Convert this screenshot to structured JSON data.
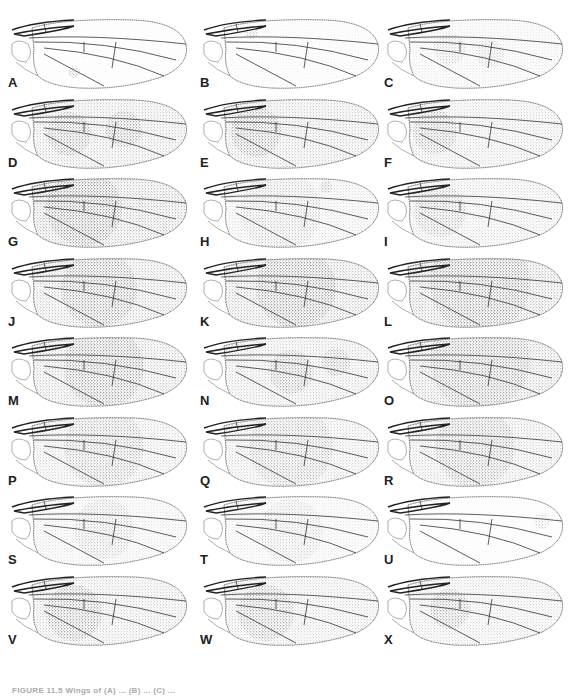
{
  "figure": {
    "panels": [
      {
        "label": "A",
        "shade": 0.05,
        "spots": [
          {
            "cx": 70,
            "cy": 58,
            "r": 6,
            "o": 0.6
          },
          {
            "cx": 80,
            "cy": 40,
            "r": 3,
            "o": 0.2
          }
        ]
      },
      {
        "label": "B",
        "shade": 0.12,
        "spots": [
          {
            "cx": 55,
            "cy": 18,
            "r": 7,
            "o": 0.5
          }
        ]
      },
      {
        "label": "C",
        "shade": 0.25,
        "spots": [
          {
            "cx": 70,
            "cy": 35,
            "r": 16,
            "o": 0.35
          },
          {
            "cx": 110,
            "cy": 40,
            "r": 14,
            "o": 0.3
          }
        ]
      },
      {
        "label": "D",
        "shade": 0.55,
        "spots": [
          {
            "cx": 65,
            "cy": 40,
            "r": 22,
            "o": 0.55
          },
          {
            "cx": 120,
            "cy": 35,
            "r": 18,
            "o": 0.55
          }
        ]
      },
      {
        "label": "E",
        "shade": 0.55,
        "spots": [
          {
            "cx": 60,
            "cy": 38,
            "r": 25,
            "o": 0.6
          }
        ]
      },
      {
        "label": "F",
        "shade": 0.45,
        "spots": [
          {
            "cx": 55,
            "cy": 38,
            "r": 22,
            "o": 0.55
          }
        ]
      },
      {
        "label": "G",
        "shade": 0.7,
        "spots": [
          {
            "cx": 80,
            "cy": 35,
            "r": 38,
            "o": 0.6
          }
        ]
      },
      {
        "label": "H",
        "shade": 0.35,
        "spots": [
          {
            "cx": 85,
            "cy": 38,
            "r": 40,
            "o": 0.3
          },
          {
            "cx": 130,
            "cy": 14,
            "r": 6,
            "o": 0.6
          }
        ]
      },
      {
        "label": "I",
        "shade": 0.4,
        "spots": [
          {
            "cx": 60,
            "cy": 38,
            "r": 26,
            "o": 0.45
          }
        ]
      },
      {
        "label": "J",
        "shade": 0.6,
        "spots": [
          {
            "cx": 95,
            "cy": 36,
            "r": 38,
            "o": 0.6
          }
        ]
      },
      {
        "label": "K",
        "shade": 0.65,
        "spots": [
          {
            "cx": 100,
            "cy": 35,
            "r": 40,
            "o": 0.6
          }
        ]
      },
      {
        "label": "L",
        "shade": 0.7,
        "spots": [
          {
            "cx": 100,
            "cy": 30,
            "r": 50,
            "o": 0.55
          }
        ]
      },
      {
        "label": "M",
        "shade": 0.6,
        "spots": [
          {
            "cx": 100,
            "cy": 35,
            "r": 40,
            "o": 0.6
          }
        ]
      },
      {
        "label": "N",
        "shade": 0.5,
        "spots": [
          {
            "cx": 95,
            "cy": 40,
            "r": 22,
            "o": 0.55
          },
          {
            "cx": 140,
            "cy": 30,
            "r": 14,
            "o": 0.5
          }
        ]
      },
      {
        "label": "O",
        "shade": 0.65,
        "spots": [
          {
            "cx": 100,
            "cy": 28,
            "r": 50,
            "o": 0.5
          }
        ]
      },
      {
        "label": "P",
        "shade": 0.45,
        "spots": [
          {
            "cx": 100,
            "cy": 35,
            "r": 40,
            "o": 0.45
          }
        ]
      },
      {
        "label": "Q",
        "shade": 0.45,
        "spots": [
          {
            "cx": 95,
            "cy": 35,
            "r": 42,
            "o": 0.4
          }
        ]
      },
      {
        "label": "R",
        "shade": 0.5,
        "spots": [
          {
            "cx": 95,
            "cy": 35,
            "r": 40,
            "o": 0.5
          }
        ]
      },
      {
        "label": "S",
        "shade": 0.3,
        "spots": [
          {
            "cx": 100,
            "cy": 38,
            "r": 30,
            "o": 0.35
          }
        ]
      },
      {
        "label": "T",
        "shade": 0.25,
        "spots": [
          {
            "cx": 95,
            "cy": 40,
            "r": 32,
            "o": 0.3
          }
        ]
      },
      {
        "label": "U",
        "shade": 0.08,
        "spots": [
          {
            "cx": 162,
            "cy": 30,
            "r": 8,
            "o": 0.4
          }
        ]
      },
      {
        "label": "V",
        "shade": 0.5,
        "spots": [
          {
            "cx": 70,
            "cy": 42,
            "r": 28,
            "o": 0.6
          }
        ]
      },
      {
        "label": "W",
        "shade": 0.45,
        "spots": [
          {
            "cx": 70,
            "cy": 42,
            "r": 28,
            "o": 0.55
          }
        ]
      },
      {
        "label": "X",
        "shade": 0.4,
        "spots": [
          {
            "cx": 70,
            "cy": 38,
            "r": 20,
            "o": 0.6
          }
        ]
      }
    ],
    "caption": "FIGURE 11.5 Wings of (A) ... (B) ... (C) ..."
  },
  "colors": {
    "ink": "#222222",
    "stipple": "#3a3a3a",
    "background": "#ffffff"
  }
}
